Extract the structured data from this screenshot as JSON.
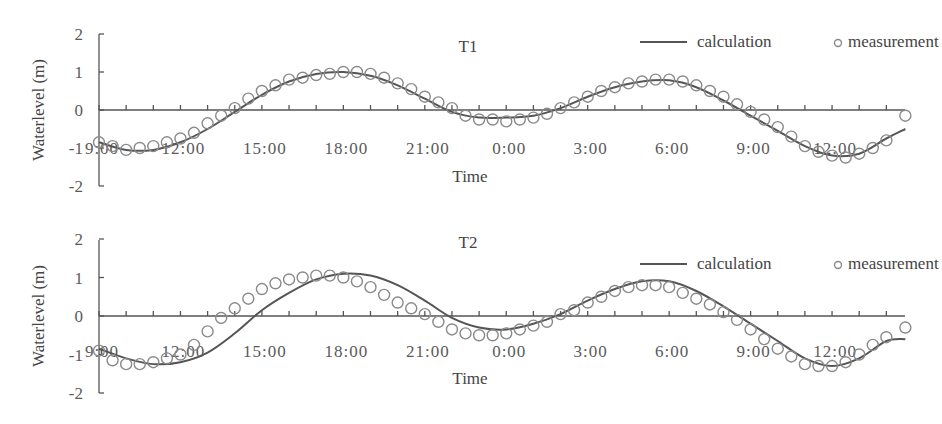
{
  "chart_data": [
    {
      "type": "line",
      "title": "T1",
      "xlabel": "Time",
      "ylabel": "Waterlevel (m)",
      "ylim": [
        -2,
        2
      ],
      "yticks": [
        "2",
        "1",
        "0",
        "-1",
        "-2"
      ],
      "xtick_labels": [
        "9:00",
        "12:00",
        "15:00",
        "18:00",
        "21:00",
        "0:00",
        "3:00",
        "6:00",
        "9:00",
        "12:00"
      ],
      "x_unit": "hours since 9:00, 0.5 h step",
      "legend": [
        "calculation",
        "measurement"
      ],
      "legend_position": "top-right",
      "grid": false,
      "series": [
        {
          "name": "calculation",
          "style": "line",
          "x": [
            0,
            1,
            2,
            3,
            4,
            5,
            6,
            7,
            8,
            9,
            10,
            11,
            12,
            13,
            14,
            15,
            16,
            17,
            18,
            19,
            20,
            21,
            22,
            23,
            24,
            25,
            26,
            27,
            28,
            29,
            29.7
          ],
          "values": [
            -0.85,
            -1.05,
            -1.05,
            -0.85,
            -0.5,
            -0.05,
            0.4,
            0.75,
            0.95,
            1.0,
            0.9,
            0.65,
            0.3,
            -0.05,
            -0.2,
            -0.2,
            -0.15,
            0.05,
            0.35,
            0.6,
            0.75,
            0.78,
            0.6,
            0.25,
            -0.15,
            -0.55,
            -0.95,
            -1.2,
            -1.15,
            -0.75,
            -0.5
          ]
        },
        {
          "name": "measurement",
          "style": "circle",
          "x": [
            0,
            0.5,
            1,
            1.5,
            2,
            2.5,
            3,
            3.5,
            4,
            4.5,
            5,
            5.5,
            6,
            6.5,
            7,
            7.5,
            8,
            8.5,
            9,
            9.5,
            10,
            10.5,
            11,
            11.5,
            12,
            12.5,
            13,
            13.5,
            14,
            14.5,
            15,
            15.5,
            16,
            16.5,
            17,
            17.5,
            18,
            18.5,
            19,
            19.5,
            20,
            20.5,
            21,
            21.5,
            22,
            22.5,
            23,
            23.5,
            24,
            24.5,
            25,
            25.5,
            26,
            26.5,
            27,
            27.5,
            28,
            28.5,
            29,
            29.7
          ],
          "values": [
            -0.85,
            -0.95,
            -1.05,
            -1.0,
            -0.95,
            -0.85,
            -0.75,
            -0.6,
            -0.35,
            -0.15,
            0.05,
            0.3,
            0.5,
            0.65,
            0.8,
            0.85,
            0.92,
            0.95,
            1.0,
            1.0,
            0.95,
            0.85,
            0.7,
            0.55,
            0.35,
            0.2,
            0.05,
            -0.15,
            -0.25,
            -0.25,
            -0.3,
            -0.25,
            -0.2,
            -0.1,
            0.05,
            0.2,
            0.35,
            0.5,
            0.6,
            0.7,
            0.75,
            0.8,
            0.8,
            0.75,
            0.65,
            0.5,
            0.35,
            0.15,
            -0.05,
            -0.25,
            -0.45,
            -0.7,
            -0.95,
            -1.1,
            -1.2,
            -1.25,
            -1.15,
            -1.0,
            -0.8,
            -0.15
          ]
        }
      ]
    },
    {
      "type": "line",
      "title": "T2",
      "xlabel": "Time",
      "ylabel": "Waterlevel (m)",
      "ylim": [
        -2,
        2
      ],
      "yticks": [
        "2",
        "1",
        "0",
        "-1",
        "-2"
      ],
      "xtick_labels": [
        "9:00",
        "12:00",
        "15:00",
        "18:00",
        "21:00",
        "0:00",
        "3:00",
        "6:00",
        "9:00",
        "12:00"
      ],
      "x_unit": "hours since 9:00, 0.5 h step",
      "legend": [
        "calculation",
        "measurement"
      ],
      "legend_position": "top-right",
      "grid": false,
      "series": [
        {
          "name": "calculation",
          "style": "line",
          "x": [
            0,
            1,
            2,
            3,
            4,
            5,
            6,
            7,
            8,
            9,
            10,
            11,
            12,
            13,
            14,
            15,
            16,
            17,
            18,
            19,
            20,
            21,
            22,
            23,
            24,
            25,
            26,
            27,
            28,
            29,
            29.7
          ],
          "values": [
            -0.85,
            -1.1,
            -1.25,
            -1.2,
            -0.95,
            -0.45,
            0.15,
            0.6,
            0.95,
            1.1,
            1.05,
            0.8,
            0.4,
            -0.05,
            -0.3,
            -0.35,
            -0.2,
            0.05,
            0.4,
            0.7,
            0.9,
            0.9,
            0.65,
            0.25,
            -0.2,
            -0.65,
            -1.1,
            -1.3,
            -1.1,
            -0.65,
            -0.6
          ]
        },
        {
          "name": "measurement",
          "style": "circle",
          "x": [
            0,
            0.5,
            1,
            1.5,
            2,
            2.5,
            3,
            3.5,
            4,
            4.5,
            5,
            5.5,
            6,
            6.5,
            7,
            7.5,
            8,
            8.5,
            9,
            9.5,
            10,
            10.5,
            11,
            11.5,
            12,
            12.5,
            13,
            13.5,
            14,
            14.5,
            15,
            15.5,
            16,
            16.5,
            17,
            17.5,
            18,
            18.5,
            19,
            19.5,
            20,
            20.5,
            21,
            21.5,
            22,
            22.5,
            23,
            23.5,
            24,
            24.5,
            25,
            25.5,
            26,
            26.5,
            27,
            27.5,
            28,
            28.5,
            29,
            29.7
          ],
          "values": [
            -0.9,
            -1.15,
            -1.25,
            -1.25,
            -1.2,
            -1.1,
            -1.0,
            -0.75,
            -0.4,
            -0.05,
            0.2,
            0.45,
            0.7,
            0.85,
            0.95,
            1.0,
            1.05,
            1.05,
            1.0,
            0.9,
            0.75,
            0.55,
            0.35,
            0.2,
            0.05,
            -0.15,
            -0.35,
            -0.45,
            -0.5,
            -0.5,
            -0.45,
            -0.35,
            -0.25,
            -0.15,
            0.05,
            0.15,
            0.35,
            0.5,
            0.65,
            0.75,
            0.8,
            0.8,
            0.75,
            0.6,
            0.45,
            0.3,
            0.1,
            -0.1,
            -0.35,
            -0.6,
            -0.85,
            -1.05,
            -1.25,
            -1.3,
            -1.3,
            -1.2,
            -1.0,
            -0.75,
            -0.55,
            -0.3
          ]
        }
      ]
    }
  ],
  "panels": [
    {
      "title": "T1",
      "ylabel": "Waterlevel (m)",
      "xlabel": "Time",
      "legend_calc": "calculation",
      "legend_meas": "measurement"
    },
    {
      "title": "T2",
      "ylabel": "Waterlevel (m)",
      "xlabel": "Time",
      "legend_calc": "calculation",
      "legend_meas": "measurement"
    }
  ]
}
